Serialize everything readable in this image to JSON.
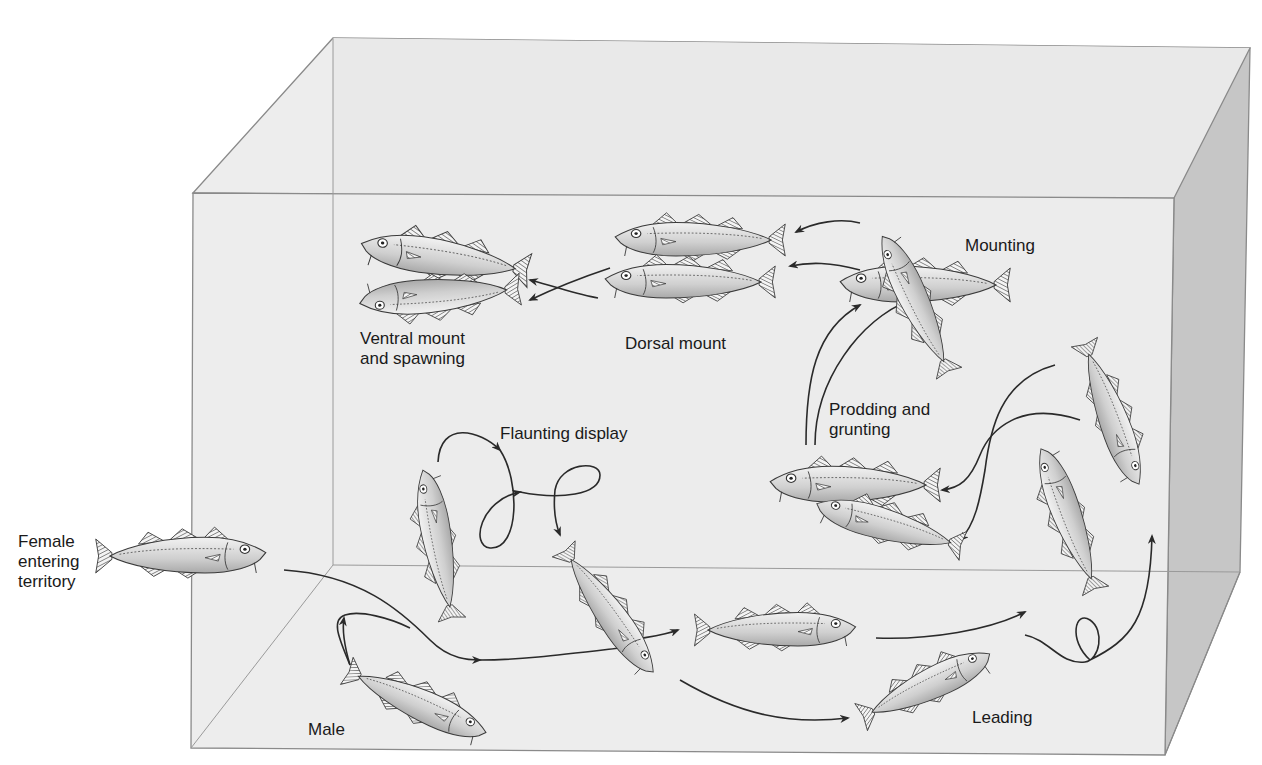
{
  "diagram": {
    "stages": [
      {
        "id": "female",
        "label": "Female\nentering\nterritory"
      },
      {
        "id": "male",
        "label": "Male"
      },
      {
        "id": "flaunting",
        "label": "Flaunting display"
      },
      {
        "id": "leading",
        "label": "Leading"
      },
      {
        "id": "prodding",
        "label": "Prodding and\ngrunting"
      },
      {
        "id": "mounting",
        "label": "Mounting"
      },
      {
        "id": "dorsal",
        "label": "Dorsal mount"
      },
      {
        "id": "ventral",
        "label": "Ventral mount\nand spawning"
      }
    ]
  },
  "colors": {
    "background": "#ffffff",
    "tank_back": "#e6e6e6",
    "tank_front": "#ececec",
    "tank_side": "#c8c8c8",
    "tank_edge": "#8a8a8a",
    "fish_fill": "#d8d8d8",
    "fish_stroke": "#3a3a3a",
    "arrow": "#2a2a2a",
    "text": "#1a1a1a"
  }
}
